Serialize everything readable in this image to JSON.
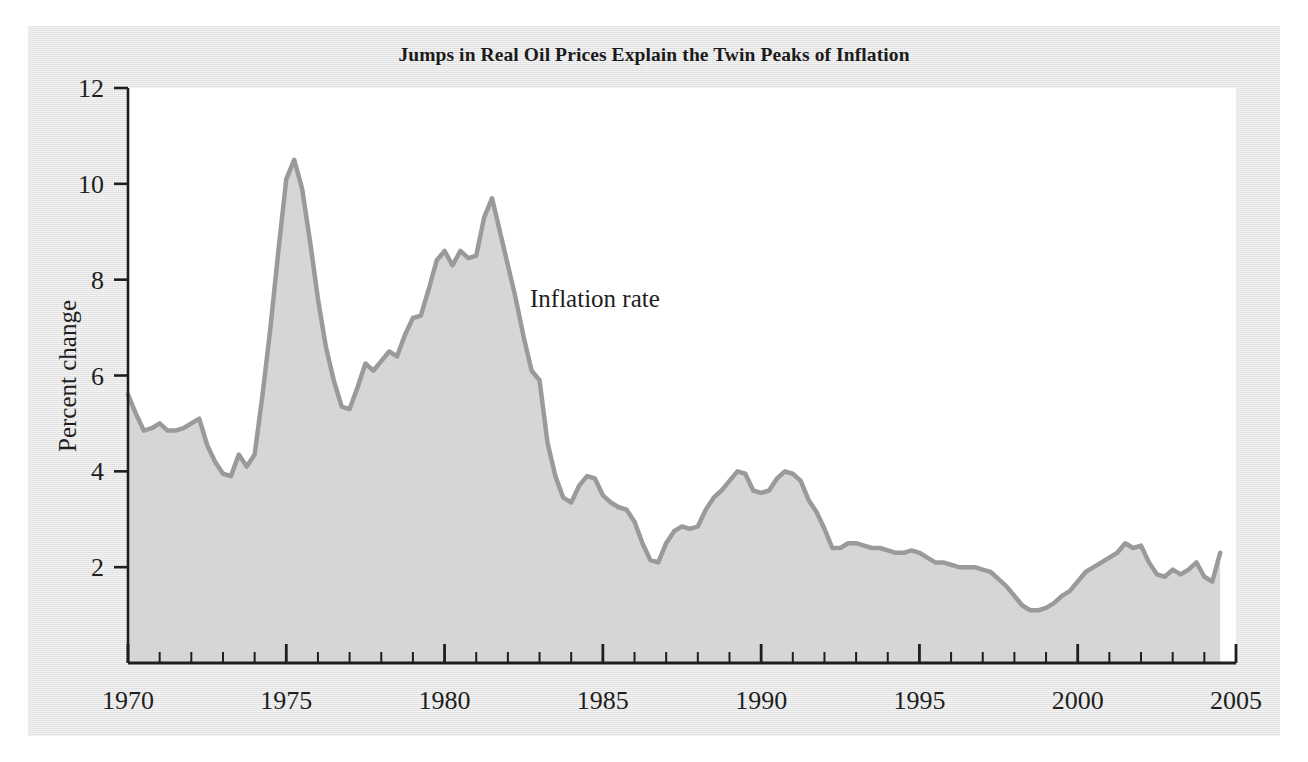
{
  "figure": {
    "title": "Jumps in Real Oil Prices Explain the Twin Peaks of Inflation",
    "background_color": "#e7e7e7",
    "plot_background_color": "#ffffff",
    "series_line_color": "#9a9a9a",
    "series_fill_color": "#d6d6d6",
    "axis_color": "#1e1e1e"
  },
  "annotations": {
    "series_label": "Inflation rate"
  },
  "axis": {
    "y_title": "Percent change",
    "y_ticks": [
      "2",
      "4",
      "6",
      "8",
      "10",
      "12"
    ],
    "x_ticks": [
      "1970",
      "1975",
      "1980",
      "1985",
      "1990",
      "1995",
      "2000",
      "2005"
    ]
  },
  "chart_data": {
    "type": "area",
    "title": "Jumps in Real Oil Prices Explain the Twin Peaks of Inflation",
    "xlabel": "",
    "ylabel": "Percent change",
    "xlim": [
      1970,
      2005
    ],
    "ylim": [
      0,
      12
    ],
    "grid": false,
    "legend": "none",
    "x_major_ticks": [
      1970,
      1975,
      1980,
      1985,
      1990,
      1995,
      2000,
      2005
    ],
    "x_minor_tick_interval": 1,
    "y_ticks": [
      2,
      4,
      6,
      8,
      10,
      12
    ],
    "series": [
      {
        "name": "Inflation rate",
        "fill": true,
        "x": [
          1970.0,
          1970.25,
          1970.5,
          1970.75,
          1971.0,
          1971.25,
          1971.5,
          1971.75,
          1972.0,
          1972.25,
          1972.5,
          1972.75,
          1973.0,
          1973.25,
          1973.5,
          1973.75,
          1974.0,
          1974.25,
          1974.5,
          1974.75,
          1975.0,
          1975.25,
          1975.5,
          1975.75,
          1976.0,
          1976.25,
          1976.5,
          1976.75,
          1977.0,
          1977.25,
          1977.5,
          1977.75,
          1978.0,
          1978.25,
          1978.5,
          1978.75,
          1979.0,
          1979.25,
          1979.5,
          1979.75,
          1980.0,
          1980.25,
          1980.5,
          1980.75,
          1981.0,
          1981.25,
          1981.5,
          1981.75,
          1982.0,
          1982.25,
          1982.5,
          1982.75,
          1983.0,
          1983.25,
          1983.5,
          1983.75,
          1984.0,
          1984.25,
          1984.5,
          1984.75,
          1985.0,
          1985.25,
          1985.5,
          1985.75,
          1986.0,
          1986.25,
          1986.5,
          1986.75,
          1987.0,
          1987.25,
          1987.5,
          1987.75,
          1988.0,
          1988.25,
          1988.5,
          1988.75,
          1989.0,
          1989.25,
          1989.5,
          1989.75,
          1990.0,
          1990.25,
          1990.5,
          1990.75,
          1991.0,
          1991.25,
          1991.5,
          1991.75,
          1992.0,
          1992.25,
          1992.5,
          1992.75,
          1993.0,
          1993.25,
          1993.5,
          1993.75,
          1994.0,
          1994.25,
          1994.5,
          1994.75,
          1995.0,
          1995.25,
          1995.5,
          1995.75,
          1996.0,
          1996.25,
          1996.5,
          1996.75,
          1997.0,
          1997.25,
          1997.5,
          1997.75,
          1998.0,
          1998.25,
          1998.5,
          1998.75,
          1999.0,
          1999.25,
          1999.5,
          1999.75,
          2000.0,
          2000.25,
          2000.5,
          2000.75,
          2001.0,
          2001.25,
          2001.5,
          2001.75,
          2002.0,
          2002.25,
          2002.5,
          2002.75,
          2003.0,
          2003.25,
          2003.5,
          2003.75,
          2004.0,
          2004.25,
          2004.5
        ],
        "values": [
          5.6,
          5.2,
          4.85,
          4.9,
          5.0,
          4.85,
          4.85,
          4.9,
          5.0,
          5.1,
          4.55,
          4.2,
          3.95,
          3.9,
          4.35,
          4.1,
          4.35,
          5.6,
          7.0,
          8.6,
          10.1,
          10.5,
          9.9,
          8.8,
          7.6,
          6.6,
          5.9,
          5.35,
          5.3,
          5.75,
          6.25,
          6.1,
          6.3,
          6.5,
          6.4,
          6.85,
          7.2,
          7.25,
          7.8,
          8.4,
          8.6,
          8.3,
          8.6,
          8.45,
          8.5,
          9.3,
          9.7,
          9.0,
          8.3,
          7.6,
          6.8,
          6.1,
          5.9,
          4.6,
          3.9,
          3.45,
          3.35,
          3.7,
          3.9,
          3.85,
          3.5,
          3.35,
          3.25,
          3.2,
          2.95,
          2.5,
          2.15,
          2.1,
          2.5,
          2.75,
          2.85,
          2.8,
          2.85,
          3.2,
          3.45,
          3.6,
          3.8,
          4.0,
          3.95,
          3.6,
          3.55,
          3.6,
          3.85,
          4.0,
          3.95,
          3.8,
          3.4,
          3.15,
          2.8,
          2.4,
          2.4,
          2.5,
          2.5,
          2.45,
          2.4,
          2.4,
          2.35,
          2.3,
          2.3,
          2.35,
          2.3,
          2.2,
          2.1,
          2.1,
          2.05,
          2.0,
          2.0,
          2.0,
          1.95,
          1.9,
          1.75,
          1.6,
          1.4,
          1.2,
          1.1,
          1.1,
          1.15,
          1.25,
          1.4,
          1.5,
          1.7,
          1.9,
          2.0,
          2.1,
          2.2,
          2.3,
          2.5,
          2.4,
          2.45,
          2.1,
          1.85,
          1.8,
          1.95,
          1.85,
          1.95,
          2.1,
          1.8,
          1.7,
          2.3
        ]
      }
    ]
  }
}
